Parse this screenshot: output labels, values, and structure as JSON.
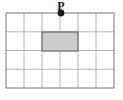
{
  "figure": {
    "title": "",
    "type": "grid-diagram",
    "background_color": "#ffffff"
  },
  "grid": {
    "columns": 6,
    "rows": 4,
    "left": 6,
    "top": 13,
    "right": 114,
    "bottom": 88,
    "cell_width": 18,
    "cell_height": 18.75,
    "line_color": "#b4b4b4",
    "border_color": "#9a9a9a",
    "line_width": 1
  },
  "shaded_region": {
    "label": "shaded-rectangle",
    "col_start": 2,
    "col_end": 4,
    "row_start": 1,
    "row_end": 2,
    "x": 42,
    "y": 32,
    "width": 36,
    "height": 19,
    "fill_color": "#cccccc",
    "stroke_color": "#666666",
    "stroke_width": 1.2
  },
  "points": [
    {
      "name": "P",
      "label": "P",
      "x": 61,
      "y": 13,
      "radius": 3.4,
      "color": "#1a1a1a",
      "label_x": 61,
      "label_y": 10,
      "label_font_size": 12,
      "label_color": "#1a1a1a"
    }
  ]
}
